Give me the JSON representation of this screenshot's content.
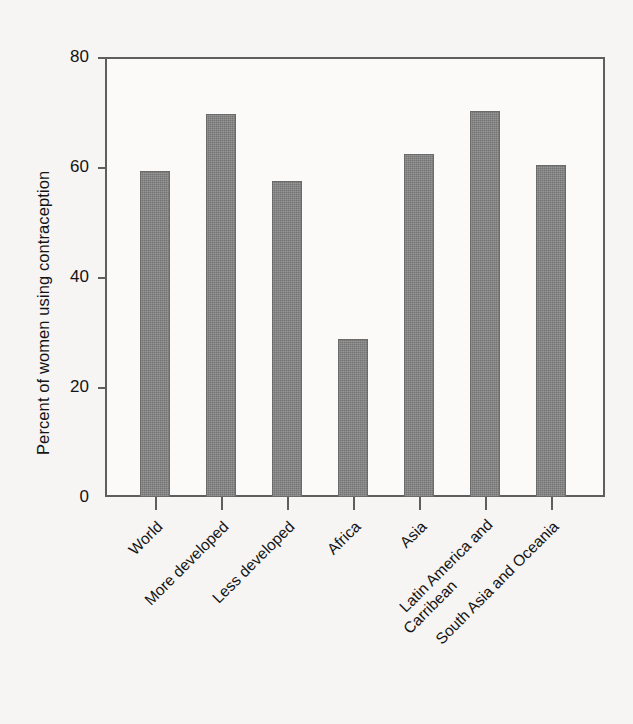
{
  "chart_data": {
    "type": "bar",
    "title": "",
    "subtitle": "",
    "xlabel": "",
    "ylabel": "Percent of women using contraception",
    "ylim": [
      0,
      80
    ],
    "yticks": [
      0,
      20,
      40,
      60,
      80
    ],
    "ytick_labels": [
      "0",
      "20",
      "40",
      "60",
      "80"
    ],
    "grid": false,
    "legend": null,
    "bar_color": "#808080",
    "frame_color": "#5e5e5e",
    "background_color": "#f6f5f3",
    "categories": [
      "World",
      "More developed",
      "Less developed",
      "Africa",
      "Asia",
      "Latin America and Carribean",
      "South Asia and Oceania"
    ],
    "values": [
      59.3,
      69.6,
      57.5,
      28.7,
      62.3,
      70.2,
      60.3
    ]
  },
  "axis": {
    "y_title": "Percent of women using contraception",
    "y_tick_labels": [
      "80",
      "60",
      "40",
      "20",
      "0"
    ],
    "x_tick_labels": [
      {
        "line1": "World",
        "line2": ""
      },
      {
        "line1": "More developed",
        "line2": ""
      },
      {
        "line1": "Less developed",
        "line2": ""
      },
      {
        "line1": "Africa",
        "line2": ""
      },
      {
        "line1": "Asia",
        "line2": ""
      },
      {
        "line1": "Latin America and",
        "line2": "Carribean"
      },
      {
        "line1": "South Asia and Oceania",
        "line2": ""
      }
    ]
  }
}
